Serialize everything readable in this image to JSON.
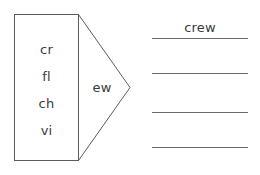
{
  "worksheet": {
    "type": "word-building-diagram",
    "ink_color": "#5c5c5c",
    "text_color": "#3a3a3a",
    "background_color": "#ffffff"
  },
  "onset_box": {
    "name": "word-beginnings",
    "items": [
      {
        "label": "cr"
      },
      {
        "label": "fl"
      },
      {
        "label": "ch"
      },
      {
        "label": "vi"
      }
    ]
  },
  "rime_arrow": {
    "name": "word-ending",
    "label": "ew"
  },
  "answers": {
    "name": "answer-lines",
    "count": 4,
    "lines": [
      {
        "value": "crew"
      },
      {
        "value": ""
      },
      {
        "value": ""
      },
      {
        "value": ""
      }
    ]
  }
}
